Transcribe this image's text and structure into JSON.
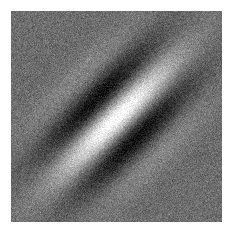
{
  "figure": {
    "kind": "gabor-patch-image",
    "canvas_width": 233,
    "canvas_height": 236,
    "background_color": "#ffffff"
  },
  "panel": {
    "x": 11,
    "y": 11,
    "width": 211,
    "height": 211,
    "mean_gray": "#6e6e6e",
    "border": "none"
  },
  "chart_data": {
    "type": "heatmap",
    "subtitle": "Oriented sinusoidal grating under a Gaussian envelope with additive pixel noise",
    "xlabel": "",
    "ylabel": "",
    "grid": false,
    "legend_position": "none",
    "colormap": "gray",
    "value_range": [
      -1,
      1
    ],
    "display_range_hex": [
      "#000000",
      "#ffffff"
    ],
    "x": [
      0,
      211
    ],
    "y": [
      0,
      211
    ],
    "width_px": 211,
    "height_px": 211,
    "gabor": {
      "center_x": 105,
      "center_y": 107,
      "orientation_deg": 45,
      "orientation_note": "bright band runs lower-left to upper-right",
      "wavelength_px": 62,
      "phase_deg": 0,
      "sigma_along_px": 56,
      "sigma_across_px": 31,
      "amplitude": 1.0,
      "baseline": 0.0
    },
    "noise": {
      "type": "gaussian-pixel-noise",
      "sigma": 0.085,
      "seed": 20240513
    },
    "features": [
      {
        "name": "bright-central-band",
        "peak_hex": "#f7f7f7",
        "center_x": 105,
        "center_y": 107,
        "orientation_deg": 45
      },
      {
        "name": "dark-band-upper-left",
        "trough_hex": "#0c0c0c",
        "center_x": 82,
        "center_y": 84,
        "orientation_deg": 45
      },
      {
        "name": "dark-band-lower-right",
        "trough_hex": "#0c0c0c",
        "center_x": 128,
        "center_y": 130,
        "orientation_deg": 45
      },
      {
        "name": "background-noise-field",
        "mean_hex": "#6e6e6e"
      }
    ]
  },
  "accessibility": {
    "alt_text": "Square grayscale noise image containing a bright diagonal band oriented at about 45 degrees, flanked by two dark diagonal bands, fading into uniform gray noise toward the corners."
  }
}
